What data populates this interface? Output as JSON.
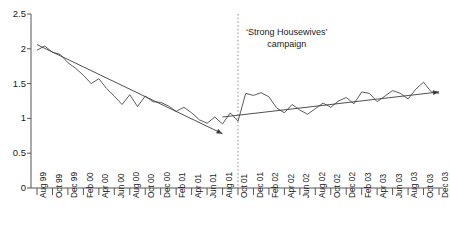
{
  "chart_data": {
    "type": "line",
    "title": "",
    "xlabel": "",
    "ylabel": "",
    "ylim": [
      0,
      2.5
    ],
    "yticks": [
      0,
      0.5,
      1,
      1.5,
      2,
      2.5
    ],
    "ytick_labels": [
      "0",
      "0.5",
      "1",
      "1.5",
      "2",
      "2.5"
    ],
    "grid": false,
    "legend": "none",
    "x": [
      "Aug 99",
      "Sep 99",
      "Oct 99",
      "Nov 99",
      "Dec 99",
      "Jan 00",
      "Feb 00",
      "Mar 00",
      "Apr 00",
      "May 00",
      "Jun 00",
      "Jul 00",
      "Aug 00",
      "Sep 00",
      "Oct 00",
      "Nov 00",
      "Dec 00",
      "Jan 01",
      "Feb 01",
      "Mar 01",
      "Apr 01",
      "May 01",
      "Jun 01",
      "Jul 01",
      "Aug 01",
      "Sep 01",
      "Oct 01",
      "Nov 01",
      "Dec 01",
      "Jan 02",
      "Feb 02",
      "Mar 02",
      "Apr 02",
      "May 02",
      "Jun 02",
      "Jul 02",
      "Aug 02",
      "Sep 02",
      "Oct 02",
      "Nov 02",
      "Dec 02",
      "Jan 03",
      "Feb 03",
      "Mar 03",
      "Apr 03",
      "May 03",
      "Jun 03",
      "Jul 03",
      "Aug 03",
      "Sep 03",
      "Oct 03",
      "Nov 03",
      "Dec 03"
    ],
    "xtick_labels": [
      "Aug 99",
      "Oct 99",
      "Dec 99",
      "Feb 00",
      "Apr 00",
      "Jun 00",
      "Aug 00",
      "Oct 00",
      "Dec 00",
      "Feb 01",
      "Apr 01",
      "Jun 01",
      "Aug 01",
      "Oct 01",
      "Dec 01",
      "Feb 02",
      "Apr 02",
      "Jun 02",
      "Aug 02",
      "Oct 02",
      "Dec 02",
      "Feb 03",
      "Apr 03",
      "Jun 03",
      "Aug 03",
      "Oct 03",
      "Dec 03"
    ],
    "xtick_every": 2,
    "series": [
      {
        "name": "sales",
        "values": [
          1.98,
          2.04,
          1.95,
          1.92,
          1.8,
          1.72,
          1.62,
          1.5,
          1.57,
          1.43,
          1.32,
          1.2,
          1.34,
          1.17,
          1.32,
          1.24,
          1.23,
          1.18,
          1.1,
          1.16,
          1.08,
          0.98,
          0.93,
          1.02,
          0.92,
          1.08,
          0.96,
          1.36,
          1.33,
          1.37,
          1.31,
          1.15,
          1.08,
          1.2,
          1.12,
          1.06,
          1.14,
          1.22,
          1.16,
          1.25,
          1.3,
          1.21,
          1.38,
          1.36,
          1.24,
          1.32,
          1.4,
          1.36,
          1.28,
          1.42,
          1.52,
          1.38,
          1.36
        ]
      }
    ],
    "trend_lines": [
      {
        "name": "pre-campaign-decline",
        "x_start": "Aug 99",
        "y_start": 2.06,
        "x_end": "Aug 01",
        "y_end": 0.78,
        "arrow": "end"
      },
      {
        "name": "post-campaign-rise",
        "x_start": "Aug 01",
        "y_start": 1.02,
        "x_end": "Dec 03",
        "y_end": 1.38,
        "arrow": "end"
      }
    ],
    "annotations": [
      {
        "name": "campaign-marker",
        "line1": "‘Strong Housewives’",
        "line2": "campaign",
        "x": "Oct 01",
        "style": "dotted-vertical-line"
      }
    ],
    "colors": {
      "series": "#4a4a4a",
      "trend": "#3c3c3c",
      "axis": "#555555",
      "marker": "#8d8d8d",
      "text": "#1a1a1a"
    }
  }
}
